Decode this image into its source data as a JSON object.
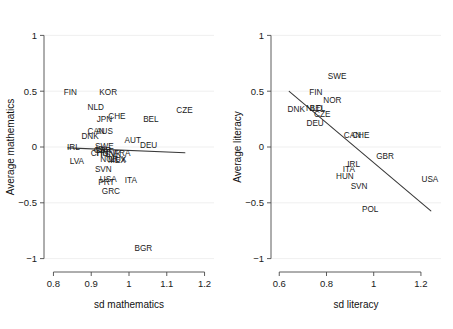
{
  "figure": {
    "type": "scatter-panel-figure",
    "panel_count": 2,
    "background": "#ffffff",
    "label_color": "#1a1a1a",
    "fit_line_color": "#3a3a3a",
    "grid_color": "#ebebeb"
  },
  "chart_data": [
    {
      "type": "scatter",
      "title": "",
      "xlabel": "sd mathematics",
      "ylabel": "Average mathematics",
      "xlim": [
        0.775,
        1.225
      ],
      "ylim": [
        -1.12,
        1.12
      ],
      "xticks": [
        0.8,
        0.9,
        1,
        1.1,
        1.2
      ],
      "xticklabels": [
        "0.8",
        "0.9",
        "1",
        "1.1",
        "1.2"
      ],
      "yticks": [
        1,
        0.5,
        0,
        -0.5,
        -1
      ],
      "yticklabels": [
        "1",
        "0.5",
        "0",
        "−0.5",
        "−1"
      ],
      "grid": "horizontal",
      "legend": "none",
      "marker_style": "text-label",
      "points": [
        {
          "label": "FIN",
          "x": 0.845,
          "y": 0.495
        },
        {
          "label": "KOR",
          "x": 0.945,
          "y": 0.495
        },
        {
          "label": "NLD",
          "x": 0.912,
          "y": 0.355
        },
        {
          "label": "CZE",
          "x": 1.147,
          "y": 0.335
        },
        {
          "label": "JPN",
          "x": 0.935,
          "y": 0.255
        },
        {
          "label": "CHE",
          "x": 0.968,
          "y": 0.275
        },
        {
          "label": "BEL",
          "x": 1.058,
          "y": 0.25
        },
        {
          "label": "CAN",
          "x": 0.913,
          "y": 0.14
        },
        {
          "label": "AUS",
          "x": 0.935,
          "y": 0.14
        },
        {
          "label": "DNK",
          "x": 0.897,
          "y": 0.098
        },
        {
          "label": "AUT",
          "x": 1.01,
          "y": 0.065
        },
        {
          "label": "DEU",
          "x": 1.052,
          "y": 0.02
        },
        {
          "label": "IRL",
          "x": 0.853,
          "y": 0.0
        },
        {
          "label": "SWE",
          "x": 0.935,
          "y": 0.01
        },
        {
          "label": "ISL",
          "x": 0.928,
          "y": -0.018
        },
        {
          "label": "GBR",
          "x": 0.93,
          "y": -0.03
        },
        {
          "label": "CHN",
          "x": 0.922,
          "y": -0.055
        },
        {
          "label": "HUN",
          "x": 0.938,
          "y": -0.058
        },
        {
          "label": "SVK",
          "x": 0.958,
          "y": -0.06
        },
        {
          "label": "FRA",
          "x": 0.982,
          "y": -0.055
        },
        {
          "label": "NOR",
          "x": 0.948,
          "y": -0.105
        },
        {
          "label": "LUX",
          "x": 0.972,
          "y": -0.105
        },
        {
          "label": "MEX",
          "x": 0.968,
          "y": -0.112
        },
        {
          "label": "LVA",
          "x": 0.862,
          "y": -0.125
        },
        {
          "label": "SVN",
          "x": 0.932,
          "y": -0.195
        },
        {
          "label": "USA",
          "x": 0.945,
          "y": -0.29
        },
        {
          "label": "PRT",
          "x": 0.94,
          "y": -0.318
        },
        {
          "label": "ITA",
          "x": 1.005,
          "y": -0.3
        },
        {
          "label": "GRC",
          "x": 0.952,
          "y": -0.392
        },
        {
          "label": "BGR",
          "x": 1.038,
          "y": -0.908
        }
      ],
      "fit_line": {
        "x0": 0.838,
        "y0": -0.008,
        "x1": 1.148,
        "y1": -0.052
      }
    },
    {
      "type": "scatter",
      "title": "",
      "xlabel": "sd literacy",
      "ylabel": "Average literacy",
      "xlim": [
        0.565,
        1.285
      ],
      "ylim": [
        -1.12,
        1.12
      ],
      "xticks": [
        0.6,
        0.8,
        1,
        1.2
      ],
      "xticklabels": [
        "0.6",
        "0.8",
        "1",
        "1.2"
      ],
      "yticks": [
        1,
        0.5,
        0,
        -0.5,
        -1
      ],
      "yticklabels": [
        "1",
        "0.5",
        "0",
        "−0.5",
        "−1"
      ],
      "grid": "horizontal",
      "legend": "none",
      "marker_style": "text-label",
      "points": [
        {
          "label": "SWE",
          "x": 0.845,
          "y": 0.64
        },
        {
          "label": "FIN",
          "x": 0.755,
          "y": 0.495
        },
        {
          "label": "NOR",
          "x": 0.825,
          "y": 0.42
        },
        {
          "label": "DNK",
          "x": 0.672,
          "y": 0.345
        },
        {
          "label": "NLD",
          "x": 0.748,
          "y": 0.352
        },
        {
          "label": "BEL",
          "x": 0.762,
          "y": 0.352
        },
        {
          "label": "CZE",
          "x": 0.782,
          "y": 0.3
        },
        {
          "label": "DEU",
          "x": 0.752,
          "y": 0.215
        },
        {
          "label": "CAN",
          "x": 0.91,
          "y": 0.11
        },
        {
          "label": "CHE",
          "x": 0.945,
          "y": 0.11
        },
        {
          "label": "GBR",
          "x": 1.048,
          "y": -0.085
        },
        {
          "label": "IRL",
          "x": 0.915,
          "y": -0.155
        },
        {
          "label": "ITA",
          "x": 0.895,
          "y": -0.195
        },
        {
          "label": "HUN",
          "x": 0.878,
          "y": -0.262
        },
        {
          "label": "USA",
          "x": 1.238,
          "y": -0.29
        },
        {
          "label": "SVN",
          "x": 0.938,
          "y": -0.345
        },
        {
          "label": "POL",
          "x": 0.985,
          "y": -0.555
        }
      ],
      "fit_line": {
        "x0": 0.642,
        "y0": 0.498,
        "x1": 1.242,
        "y1": -0.572
      }
    }
  ]
}
